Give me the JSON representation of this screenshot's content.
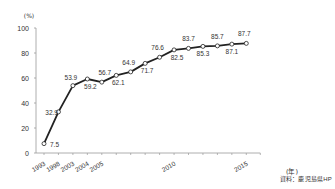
{
  "chart_data": {
    "type": "line",
    "title": "",
    "xlabel": "(年)",
    "ylabel": "(%)",
    "ylim": [
      0,
      100
    ],
    "yticks": [
      0,
      20,
      40,
      60,
      80,
      100
    ],
    "grid": false,
    "legend": null,
    "x": [
      "1993",
      "1998",
      "2003",
      "2004",
      "2005",
      "2006",
      "2007",
      "2008",
      "2009",
      "2010",
      "2011",
      "2012",
      "2013",
      "2014",
      "2015"
    ],
    "xtick_labels_shown": [
      "1993",
      "1998",
      "2003",
      "2004",
      "2005",
      "2010",
      "2015"
    ],
    "series": [
      {
        "name": "",
        "values": [
          7.5,
          32.9,
          53.9,
          59.2,
          56.7,
          62.1,
          64.9,
          71.7,
          76.6,
          82.5,
          83.7,
          85.3,
          85.7,
          87.1,
          87.7
        ],
        "data_labels": [
          "7.5",
          "32.9",
          "53.9",
          "59.2",
          "56.7",
          "62.1",
          "64.9",
          "71.7",
          "76.6",
          "82.5",
          "83.7",
          "85.3",
          "85.7",
          "87.1",
          "87.7"
        ],
        "color": "#222222",
        "marker": "open-circle"
      }
    ],
    "source": "資料：鹿児島県HP"
  },
  "labels": {
    "y_unit": "(%)",
    "x_unit": "(年)",
    "source": "資料：鹿児島県HP"
  },
  "colors": {
    "line": "#222222",
    "axis": "#999999",
    "text": "#333333",
    "marker_fill": "#ffffff"
  }
}
